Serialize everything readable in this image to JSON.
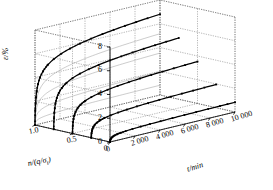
{
  "figure": {
    "type": "3d-creep-plot",
    "background": "#ffffff",
    "line_color": "#000000",
    "ghost_color": "#9a9a9a",
    "grid_color": "#555555",
    "marker": "square"
  },
  "axes": {
    "vertical": {
      "name": "ε/%",
      "name_parts": {
        "symbol": "ε",
        "unit": "/%"
      },
      "ticks": [
        0,
        2,
        4,
        6,
        8
      ],
      "tick_labels": [
        "0",
        "2",
        "4",
        "6",
        "8"
      ],
      "range": [
        0,
        8
      ]
    },
    "depth": {
      "name": "n/(q/σt)",
      "name_parts": {
        "symbol": "n",
        "slash": "/(",
        "q": "q",
        "div": "/",
        "sigma": "σ",
        "sub": "t",
        "close": ")"
      },
      "ticks": [
        1.0,
        0.5,
        0.0
      ],
      "tick_labels": [
        "1.0",
        "0.5",
        "0"
      ],
      "range": [
        0.0,
        1.0
      ]
    },
    "horizontal": {
      "name": "t/min",
      "ticks": [
        0,
        2000,
        4000,
        6000,
        8000,
        10000
      ],
      "tick_labels": [
        "0",
        "2 000",
        "4 000",
        "6 000",
        "8 000",
        "10 000"
      ],
      "range": [
        0,
        10000
      ]
    }
  },
  "chart_data": {
    "type": "line",
    "title": "",
    "xlabel": "t/min",
    "ylabel": "ε/%",
    "zlabel": "n/(q/σt)",
    "xlim": [
      0,
      10000
    ],
    "ylim": [
      0,
      8
    ],
    "zlim": [
      0,
      1.0
    ],
    "grid": true,
    "legend": "none",
    "projection": "oblique-3d",
    "series": [
      {
        "name": "n = 1.0",
        "z": 1.0,
        "color": "#000000",
        "x": [
          0,
          20,
          45,
          80,
          140,
          240,
          400,
          650,
          1000,
          1500,
          2100,
          2800,
          3600,
          4500,
          5400,
          6300,
          7200,
          8100,
          9000,
          10000
        ],
        "y": [
          0.0,
          2.1,
          3.05,
          3.7,
          4.2,
          4.62,
          4.96,
          5.26,
          5.5,
          5.72,
          5.9,
          6.05,
          6.18,
          6.3,
          6.4,
          6.5,
          6.58,
          6.66,
          6.73,
          6.8
        ]
      },
      {
        "name": "n = 0.75",
        "z": 0.75,
        "color": "#000000",
        "x": [
          0,
          20,
          45,
          80,
          140,
          240,
          400,
          650,
          1000,
          1500,
          2100,
          2800,
          3600,
          4500,
          5400,
          6300,
          7200,
          8100,
          9000,
          10000
        ],
        "y": [
          0.0,
          1.55,
          2.25,
          2.74,
          3.12,
          3.44,
          3.7,
          3.94,
          4.12,
          4.3,
          4.44,
          4.56,
          4.67,
          4.76,
          4.85,
          4.92,
          4.99,
          5.05,
          5.11,
          5.16
        ]
      },
      {
        "name": "n = 0.5",
        "z": 0.5,
        "color": "#000000",
        "x": [
          0,
          20,
          45,
          80,
          140,
          240,
          400,
          650,
          1000,
          1500,
          2100,
          2800,
          3600,
          4500,
          5400,
          6300,
          7200,
          8100,
          9000,
          10000
        ],
        "y": [
          0.0,
          1.05,
          1.52,
          1.85,
          2.1,
          2.32,
          2.5,
          2.66,
          2.79,
          2.91,
          3.01,
          3.09,
          3.17,
          3.24,
          3.3,
          3.35,
          3.4,
          3.45,
          3.49,
          3.53
        ]
      },
      {
        "name": "n = 0.25",
        "z": 0.25,
        "color": "#000000",
        "x": [
          0,
          25,
          55,
          100,
          170,
          280,
          450,
          700,
          1050,
          1550,
          2150,
          2850,
          3650,
          4550,
          5450,
          6350,
          7250,
          8150,
          9050,
          10000
        ],
        "y": [
          0.0,
          0.58,
          0.84,
          1.02,
          1.16,
          1.28,
          1.38,
          1.47,
          1.54,
          1.61,
          1.66,
          1.71,
          1.75,
          1.79,
          1.82,
          1.85,
          1.88,
          1.91,
          1.93,
          1.96
        ]
      },
      {
        "name": "n = 0",
        "z": 0.0,
        "color": "#000000",
        "x": [
          0,
          30,
          70,
          130,
          220,
          360,
          560,
          850,
          1250,
          1800,
          2450,
          3200,
          4050,
          5000,
          5950,
          6900,
          7850,
          8800,
          9400,
          10000
        ],
        "y": [
          0.0,
          0.24,
          0.35,
          0.43,
          0.49,
          0.54,
          0.58,
          0.62,
          0.65,
          0.68,
          0.7,
          0.72,
          0.74,
          0.75,
          0.77,
          0.78,
          0.79,
          0.8,
          0.81,
          0.82
        ]
      }
    ],
    "ghost_series": [
      {
        "name": "back-wall projection 1",
        "color": "#9a9a9a",
        "y_max": 6.8
      },
      {
        "name": "back-wall projection 2",
        "color": "#9a9a9a",
        "y_max": 5.16
      },
      {
        "name": "back-wall projection 3",
        "color": "#9a9a9a",
        "y_max": 3.53
      },
      {
        "name": "back-wall projection 4",
        "color": "#9a9a9a",
        "y_max": 1.96
      },
      {
        "name": "back-wall projection 5",
        "color": "#9a9a9a",
        "y_max": 0.82
      }
    ]
  }
}
